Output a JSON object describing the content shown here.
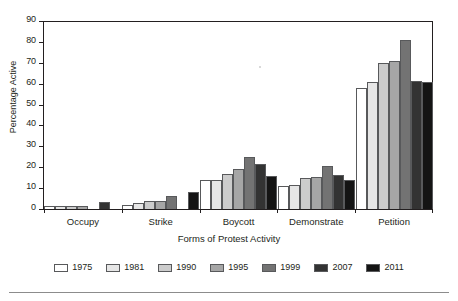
{
  "chart_data": {
    "type": "bar",
    "title": "",
    "xlabel": "Forms of Protest Activity",
    "ylabel": "Percentage Active",
    "ylim": [
      0,
      90
    ],
    "yticks": [
      0,
      10,
      20,
      30,
      40,
      50,
      60,
      70,
      80,
      90
    ],
    "grid": false,
    "legend_position": "bottom",
    "categories": [
      "Occupy",
      "Strike",
      "Boycott",
      "Demonstrate",
      "Petition"
    ],
    "series": [
      {
        "name": "1975",
        "color": "#ffffff",
        "values": [
          1.5,
          2.0,
          14.0,
          11.0,
          58.0
        ]
      },
      {
        "name": "1981",
        "color": "#e6e6e6",
        "values": [
          1.5,
          3.0,
          14.0,
          11.5,
          61.0
        ]
      },
      {
        "name": "1990",
        "color": "#cccccc",
        "values": [
          1.5,
          4.0,
          17.0,
          15.0,
          70.0
        ]
      },
      {
        "name": "1995",
        "color": "#a6a6a6",
        "values": [
          1.5,
          4.0,
          19.0,
          15.5,
          71.0
        ]
      },
      {
        "name": "1999",
        "color": "#737373",
        "values": [
          0.0,
          6.0,
          25.0,
          20.5,
          81.0
        ]
      },
      {
        "name": "2007",
        "color": "#333333",
        "values": [
          3.5,
          0.0,
          21.5,
          16.5,
          61.5
        ]
      },
      {
        "name": "2011",
        "color": "#141414",
        "values": [
          0.0,
          8.0,
          16.0,
          14.0,
          61.0
        ]
      }
    ]
  },
  "axes": {
    "y_tick_labels": [
      "0",
      "10",
      "20",
      "30",
      "40",
      "50",
      "60",
      "70",
      "80",
      "90"
    ],
    "y_axis_title": "Percentage Active",
    "x_axis_title": "Forms of Protest Activity",
    "x_tick_labels": [
      "Occupy",
      "Strike",
      "Boycott",
      "Demonstrate",
      "Petition"
    ]
  },
  "legend": {
    "entries": [
      {
        "label": "1975",
        "color": "#ffffff"
      },
      {
        "label": "1981",
        "color": "#e6e6e6"
      },
      {
        "label": "1990",
        "color": "#cccccc"
      },
      {
        "label": "1995",
        "color": "#a6a6a6"
      },
      {
        "label": "1999",
        "color": "#737373"
      },
      {
        "label": "2007",
        "color": "#333333"
      },
      {
        "label": "2011",
        "color": "#141414"
      }
    ]
  }
}
